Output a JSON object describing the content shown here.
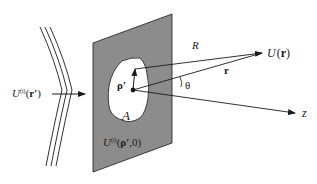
{
  "diagram": {
    "type": "diffraction-geometry",
    "colors": {
      "screen_fill": "#8c8c8c",
      "aperture_fill": "#ffffff",
      "stroke": "#1a1a1a",
      "background": "#ffffff"
    },
    "labels": {
      "incident_field": {
        "U": "U",
        "sup": "(i)",
        "arg_open": "(",
        "arg": "r′",
        "arg_close": ")"
      },
      "aperture_field": {
        "U": "U",
        "sup": "(i)",
        "arg_open": "(",
        "arg": "ρ′",
        "arg_tail": ",0)"
      },
      "aperture_area": "A",
      "rho_prime": "ρ′",
      "distance_R": "R",
      "position_r": "r",
      "observed_field": {
        "U": "U",
        "arg_open": "(",
        "arg": "r",
        "arg_close": ")"
      },
      "angle": "θ",
      "axis": "z"
    }
  }
}
